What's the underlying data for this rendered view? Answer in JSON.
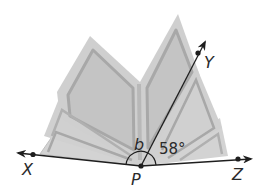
{
  "diagram": {
    "type": "angles-on-a-line",
    "background_object": "open-book",
    "points": {
      "P": {
        "label": "P",
        "x": 141,
        "y": 166
      },
      "X": {
        "label": "X",
        "x": 33,
        "y": 154
      },
      "Y": {
        "label": "Y",
        "x": 198,
        "y": 52
      },
      "Z": {
        "label": "Z",
        "x": 238,
        "y": 159
      }
    },
    "rays": [
      {
        "from": "P",
        "through": "X",
        "name": "ray-PX"
      },
      {
        "from": "P",
        "through": "Y",
        "name": "ray-PY"
      },
      {
        "from": "P",
        "through": "Z",
        "name": "ray-PZ"
      }
    ],
    "angles": {
      "b": {
        "label": "b",
        "between": [
          "X",
          "Y"
        ],
        "vertex": "P"
      },
      "ypz": {
        "label": "58°",
        "value": 58,
        "between": [
          "Y",
          "Z"
        ],
        "vertex": "P"
      }
    },
    "colors": {
      "book_fill": "#c8c8c8",
      "book_page_border": "#a9a9a9",
      "book_outer": "#d6d6d6",
      "line": "#1e1e1e"
    }
  }
}
